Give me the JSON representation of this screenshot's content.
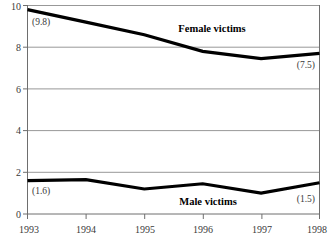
{
  "chart_data": {
    "type": "line",
    "title": "",
    "subtitle": "",
    "xlabel": "",
    "ylabel": "",
    "x": [
      1993,
      1994,
      1995,
      1996,
      1997,
      1998
    ],
    "categories": [
      "1993",
      "1994",
      "1995",
      "1996",
      "1997",
      "1998"
    ],
    "xlim": [
      1993,
      1998
    ],
    "ylim": [
      0,
      10
    ],
    "yticks": [
      0,
      2,
      4,
      6,
      8,
      10
    ],
    "ytick_labels": [
      "0",
      "2",
      "4",
      "6",
      "8",
      "10"
    ],
    "xtick_labels": [
      "1993",
      "1994",
      "1995",
      "1996",
      "1997",
      "1998"
    ],
    "grid": "horizontal",
    "legend": "inline-annotations",
    "series": [
      {
        "name": "Female victims",
        "values": [
          9.8,
          9.2,
          8.6,
          7.8,
          7.45,
          7.7
        ],
        "color": "#000000",
        "label_text": "Female victims",
        "endpoint_labels": [
          "(9.8)",
          "(7.5)"
        ]
      },
      {
        "name": "Male victims",
        "values": [
          1.6,
          1.65,
          1.2,
          1.45,
          1.0,
          1.5
        ],
        "color": "#000000",
        "label_text": "Male victims",
        "endpoint_labels": [
          "(1.6)",
          "(1.5)"
        ]
      }
    ],
    "annotations": [
      {
        "name": "female-start-value",
        "text": "(9.8)",
        "x": 1993,
        "y": 9.0
      },
      {
        "name": "female-end-value",
        "text": "(7.5)",
        "x": 1998,
        "y": 6.9
      },
      {
        "name": "male-start-value",
        "text": "(1.6)",
        "x": 1993,
        "y": 1.0
      },
      {
        "name": "male-end-value",
        "text": "(1.5)",
        "x": 1998,
        "y": 0.75
      },
      {
        "name": "female-series-label",
        "text": "Female victims",
        "x": 1995.7,
        "y": 8.95
      },
      {
        "name": "male-series-label",
        "text": "Male victims",
        "x": 1996.2,
        "y": 0.6
      }
    ]
  },
  "axes": {
    "y": {
      "tick_0": "0",
      "tick_2": "2",
      "tick_4": "4",
      "tick_6": "6",
      "tick_8": "8",
      "tick_10": "10"
    },
    "x": {
      "tick_1993": "1993",
      "tick_1994": "1994",
      "tick_1995": "1995",
      "tick_1996": "1996",
      "tick_1997": "1997",
      "tick_1998": "1998"
    }
  },
  "labels": {
    "female_series": "Female victims",
    "male_series": "Male victims",
    "female_start": "(9.8)",
    "female_end": "(7.5)",
    "male_start": "(1.6)",
    "male_end": "(1.5)"
  },
  "colors": {
    "line": "#000000",
    "grid": "#8c8c8c",
    "axis": "#6e6e6e",
    "text": "#3a3a3a",
    "background": "#ffffff"
  }
}
